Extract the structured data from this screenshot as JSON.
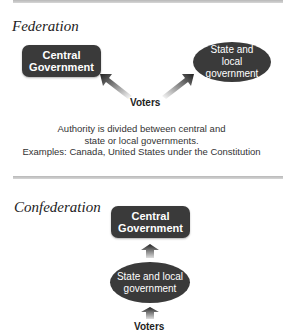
{
  "federation": {
    "title": "Federation",
    "central_box": "Central Government",
    "state_ellipse": "State and local government",
    "voters": "Voters",
    "caption": [
      "Authority is divided between central and",
      "state or local governments.",
      "Examples: Canada, United States under the Constitution"
    ]
  },
  "confederation": {
    "title": "Confederation",
    "central_box": "Central Government",
    "state_ellipse": "State and local government",
    "voters": "Voters"
  },
  "colors": {
    "box_fill": "#3a3a3a",
    "rule": "#c0c0c0"
  }
}
